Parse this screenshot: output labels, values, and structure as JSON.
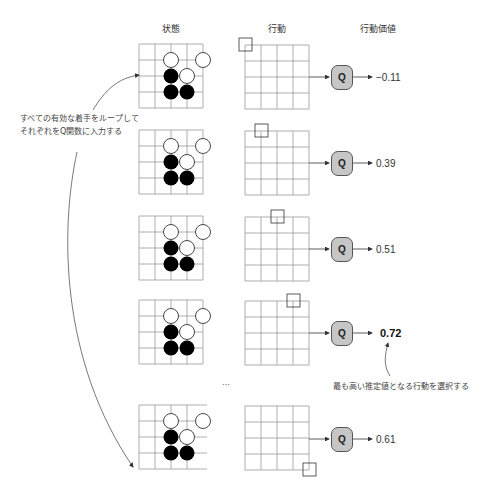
{
  "headers": {
    "state": "状態",
    "action": "行動",
    "action_value": "行動価値"
  },
  "notes": {
    "loop_line1": "すべての有効な着手をループして",
    "loop_line2": "それぞれをQ関数に入力する",
    "select": "最も高い推定値となる行動を選択する"
  },
  "q_label": "Q",
  "ellipsis": "…",
  "rows": [
    {
      "value": "−0.11",
      "action_cell": [
        0,
        0
      ],
      "best": false
    },
    {
      "value": "0.39",
      "action_cell": [
        1,
        0
      ],
      "best": false
    },
    {
      "value": "0.51",
      "action_cell": [
        2,
        0
      ],
      "best": false
    },
    {
      "value": "0.72",
      "action_cell": [
        3,
        0
      ],
      "best": true
    },
    {
      "value": "0.61",
      "action_cell": [
        4,
        4
      ],
      "best": false
    }
  ],
  "board": {
    "size": 5,
    "white_stones": [
      [
        2,
        1
      ],
      [
        4,
        1
      ],
      [
        3,
        2
      ]
    ],
    "black_stones": [
      [
        2,
        2
      ],
      [
        2,
        3
      ],
      [
        3,
        3
      ]
    ]
  },
  "colors": {
    "grid": "#999999",
    "q_fill": "#c6c6c6",
    "stroke": "#333333"
  }
}
